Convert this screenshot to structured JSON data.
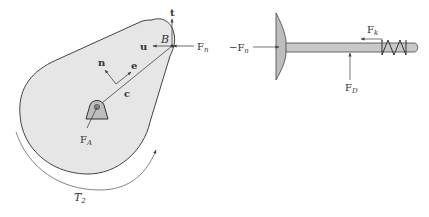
{
  "figure": {
    "left_panel": {
      "name": "cam free-body diagram",
      "labels": {
        "point_b": "B",
        "tangent_vector": "t",
        "normal_u_vector": "u",
        "normal_force": "F",
        "normal_force_sub": "n",
        "n_vector": "n",
        "e_vector": "e",
        "c_vector": "c",
        "pivot_force": "F",
        "pivot_force_sub": "A",
        "torque": "T",
        "torque_sub": "2"
      }
    },
    "right_panel": {
      "name": "valve free-body diagram",
      "labels": {
        "neg_normal_force": "−F",
        "neg_normal_force_sub": "n",
        "spring_force": "F",
        "spring_force_sub": "k",
        "guide_force": "F",
        "guide_force_sub": "D"
      }
    },
    "colors": {
      "stroke": "#444444",
      "fill": "#e6e6e6",
      "stem_fill": "#c8c8c8",
      "text": "#333333"
    }
  }
}
